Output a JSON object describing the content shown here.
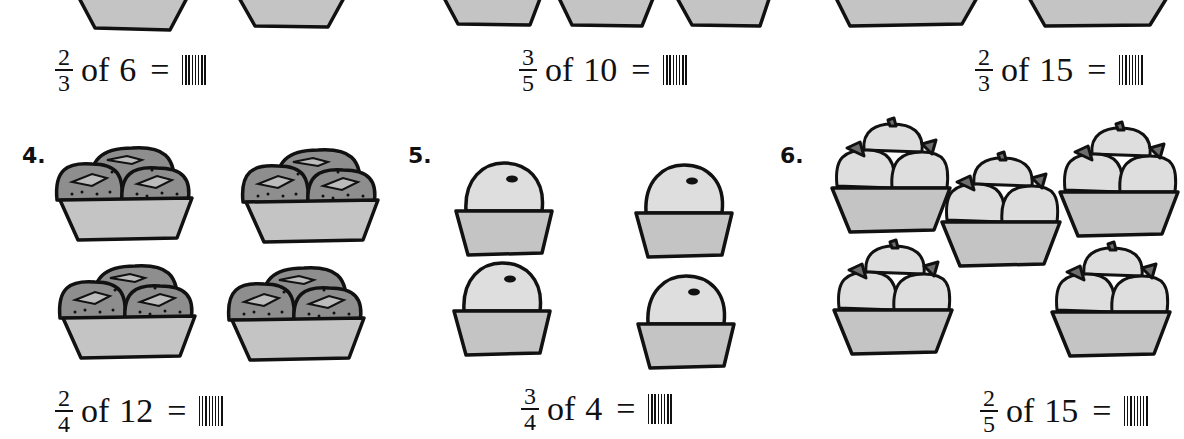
{
  "worksheet": {
    "top_row": [
      {
        "fraction": {
          "numerator": "2",
          "denominator": "3"
        },
        "of_text": "of",
        "whole": "6",
        "equals": "=",
        "answer": ""
      },
      {
        "fraction": {
          "numerator": "3",
          "denominator": "5"
        },
        "of_text": "of",
        "whole": "10",
        "equals": "=",
        "answer": ""
      },
      {
        "fraction": {
          "numerator": "2",
          "denominator": "3"
        },
        "of_text": "of",
        "whole": "15",
        "equals": "=",
        "answer": ""
      }
    ],
    "problems": [
      {
        "number": "4.",
        "picture": "strawberry-baskets",
        "basket_count": 4,
        "equation": {
          "fraction": {
            "numerator": "2",
            "denominator": "4"
          },
          "of_text": "of",
          "whole": "12",
          "equals": "=",
          "answer": ""
        }
      },
      {
        "number": "5.",
        "picture": "orange-baskets",
        "basket_count": 4,
        "equation": {
          "fraction": {
            "numerator": "3",
            "denominator": "4"
          },
          "of_text": "of",
          "whole": "4",
          "equals": "=",
          "answer": ""
        }
      },
      {
        "number": "6.",
        "picture": "apple-baskets",
        "basket_count": 5,
        "equation": {
          "fraction": {
            "numerator": "2",
            "denominator": "5"
          },
          "of_text": "of",
          "whole": "15",
          "equals": "=",
          "answer": ""
        }
      }
    ]
  },
  "colors": {
    "ink": "#111111",
    "basket_fill": "#c4c4c4",
    "strawberry_fill": "#8e8e8e",
    "fruit_fill": "#dedede",
    "leaf_fill": "#6e6e6e",
    "background": "#ffffff"
  }
}
